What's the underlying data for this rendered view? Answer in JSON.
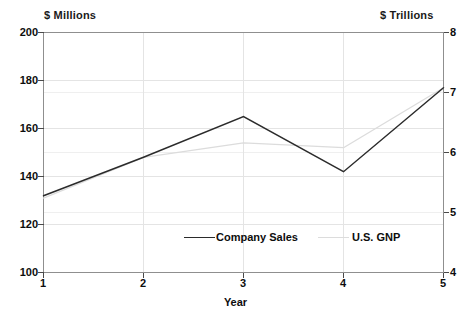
{
  "chart_data": {
    "type": "line",
    "title": "",
    "xlabel": "Year",
    "x": [
      1,
      2,
      3,
      4,
      5
    ],
    "xticklabels": [
      "1",
      "2",
      "3",
      "4",
      "5"
    ],
    "grid": true,
    "legend_position": "inside-bottom-center",
    "left_axis": {
      "label": "$ Millions",
      "ylim": [
        100,
        200
      ],
      "ticks": [
        200,
        180,
        160,
        140,
        120,
        100
      ],
      "ticklabels": [
        "200",
        "180",
        "160",
        "140",
        "120",
        "100"
      ]
    },
    "right_axis": {
      "label": "$ Trillions",
      "ylim": [
        4,
        8
      ],
      "ticks": [
        8,
        7,
        6,
        5,
        4
      ],
      "ticklabels": [
        "8",
        "7",
        "6",
        "5",
        "4"
      ]
    },
    "series": [
      {
        "name": "Company Sales",
        "axis": "left",
        "color": "#2b2b2b",
        "values": [
          132,
          148,
          165,
          142,
          177
        ]
      },
      {
        "name": "U.S. GNP",
        "axis": "left",
        "color": "#dcdcdc",
        "values": [
          131,
          148,
          154,
          152,
          177
        ]
      }
    ]
  },
  "labels": {
    "left_unit": "$ Millions",
    "right_unit": "$ Trillions",
    "x_title": "Year",
    "left_ticks": [
      "200",
      "180",
      "160",
      "140",
      "120",
      "100"
    ],
    "right_ticks": [
      "8",
      "7",
      "6",
      "5",
      "4"
    ],
    "x_ticks": [
      "1",
      "2",
      "3",
      "4",
      "5"
    ],
    "legend": {
      "sales": "Company Sales",
      "gnp": "U.S. GNP"
    }
  },
  "colors": {
    "sales_line": "#2b2b2b",
    "gnp_line": "#dcdcdc",
    "frame": "#8c8c8c",
    "gridline": "#e2e2e2",
    "text": "#0d0d0d",
    "background": "#ffffff"
  }
}
